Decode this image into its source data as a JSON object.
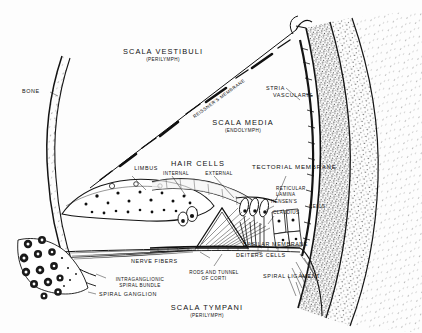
{
  "figure": {
    "ink_color": "#111111",
    "paper_color": "#fdfdfd"
  },
  "labels": {
    "scala_vestibuli": {
      "main": "SCALA VESTIBULI",
      "sub": "(PERILYMPH)"
    },
    "scala_media": {
      "main": "SCALA MEDIA",
      "sub": "(ENDOLYMPH)"
    },
    "scala_tympani": {
      "main": "SCALA TYMPANI",
      "sub": "(PERILYMPH)"
    },
    "bone": {
      "main": "BONE"
    },
    "reissners_membrane": {
      "main": "REISSNER'S MEMBRANE"
    },
    "stria_vascularis_line1": {
      "main": "STRIA"
    },
    "stria_vascularis_line2": {
      "main": "VASCULARIS"
    },
    "limbus": {
      "main": "LIMBUS"
    },
    "hair_cells": {
      "main": "HAIR CELLS"
    },
    "hair_cells_internal": {
      "main": "INTERNAL"
    },
    "hair_cells_external": {
      "main": "EXTERNAL"
    },
    "tectorial_membrane": {
      "main": "TECTORIAL MEMBRANE"
    },
    "reticular_lamina": {
      "main": "RETICULAR",
      "sub": "LAMINA"
    },
    "hensens": {
      "main": "HENSEN'S"
    },
    "claudius": {
      "main": "CLAUDIUS"
    },
    "cells": {
      "main": "CELLS"
    },
    "basilar_membrane": {
      "main": "BASILAR MEMBRANE"
    },
    "deiters_cells": {
      "main": "DEITERS CELLS"
    },
    "spiral_ligament": {
      "main": "SPIRAL LIGAMENT"
    },
    "nerve_fibers": {
      "main": "NERVE FIBERS"
    },
    "rods_and_tunnel": {
      "main": "RODS AND TUNNEL",
      "sub": "OF CORTI"
    },
    "intraganglionic": {
      "main": "INTRAGANGLIONIC",
      "sub": "SPIRAL BUNDLE"
    },
    "spiral_ganglion": {
      "main": "SPIRAL GANGLION"
    }
  }
}
